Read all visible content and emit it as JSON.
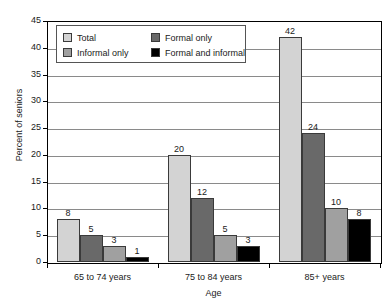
{
  "chart_data": {
    "type": "bar",
    "title": "",
    "xlabel": "Age",
    "ylabel": "Percent of seniors",
    "ylim": [
      0,
      45
    ],
    "ytick_step": 5,
    "yticks": [
      "0",
      "5",
      "10",
      "15",
      "20",
      "25",
      "30",
      "35",
      "40",
      "45"
    ],
    "grid": true,
    "legend_position": "upper-left-inside",
    "categories": [
      "65 to 74 years",
      "75 to 84 years",
      "85+ years"
    ],
    "series": [
      {
        "name": "Total",
        "color": "#d3d3d3",
        "values": [
          8,
          20,
          42
        ]
      },
      {
        "name": "Informal only",
        "color": "#696969",
        "values": [
          5,
          12,
          24
        ]
      },
      {
        "name": "Formal only",
        "color": "#a0a0a0",
        "values": [
          3,
          5,
          10
        ]
      },
      {
        "name": "Formal and informal",
        "color": "#000000",
        "values": [
          1,
          3,
          8
        ]
      }
    ],
    "legend_order": [
      "Total",
      "Formal only",
      "Informal only",
      "Formal and informal"
    ],
    "legend_swatches": {
      "Total": "#d3d3d3",
      "Formal only": "#696969",
      "Informal only": "#a0a0a0",
      "Formal and informal": "#000000"
    }
  }
}
